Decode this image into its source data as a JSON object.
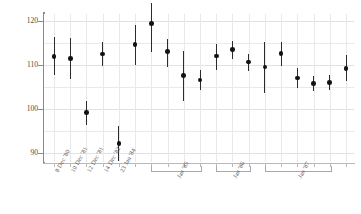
{
  "chart_data": {
    "type": "scatter",
    "title": "",
    "subtitle": "",
    "xlabel": "",
    "ylabel": "MEAN WEIGHT (g)",
    "ylim": [
      88,
      121.5
    ],
    "yticks": [
      90,
      100,
      110,
      120
    ],
    "ytick_labels": [
      "90",
      "100",
      "110",
      "120"
    ],
    "grid": true,
    "legend": null,
    "error_bar_type": "95% CI",
    "x": [
      1,
      2,
      3,
      4,
      5,
      6,
      7,
      8,
      9,
      10,
      11,
      12,
      13,
      14,
      15,
      16,
      17,
      18,
      19
    ],
    "categories": [
      "8 Dec '80",
      "10 Dec '81",
      "12 Dec '81",
      "14 Dec '82",
      "23 Jan '84",
      "",
      "",
      "",
      "",
      "",
      "",
      "",
      "",
      "",
      "",
      "",
      "",
      "",
      ""
    ],
    "values": [
      111.9,
      111.4,
      99.2,
      112.4,
      92.2,
      114.6,
      119.4,
      113.0,
      107.6,
      106.6,
      112.0,
      113.4,
      110.6,
      109.5,
      112.6,
      107.0,
      105.8,
      106.0,
      109.2
    ],
    "err_low": [
      107.6,
      106.8,
      96.3,
      109.7,
      88.2,
      110.0,
      112.9,
      109.6,
      101.9,
      104.3,
      108.9,
      111.4,
      108.6,
      103.6,
      109.7,
      104.8,
      104.0,
      104.3,
      106.3
    ],
    "err_high": [
      116.2,
      116.1,
      101.8,
      115.1,
      96.2,
      118.9,
      124.0,
      115.9,
      113.2,
      108.9,
      114.8,
      115.3,
      112.5,
      115.1,
      115.2,
      109.2,
      107.5,
      107.7,
      112.2
    ],
    "group_brackets": [
      {
        "label": "Jan '85",
        "start_index": 6,
        "end_index": 9
      },
      {
        "label": "Jan '86",
        "start_index": 10,
        "end_index": 12
      },
      {
        "label": "Jan '87",
        "start_index": 13,
        "end_index": 17
      },
      {
        "label": "2 Jan '89",
        "start_index": 19,
        "end_index": 19
      }
    ]
  },
  "axis": {
    "y_title": "MEAN WEIGHT (g)"
  }
}
